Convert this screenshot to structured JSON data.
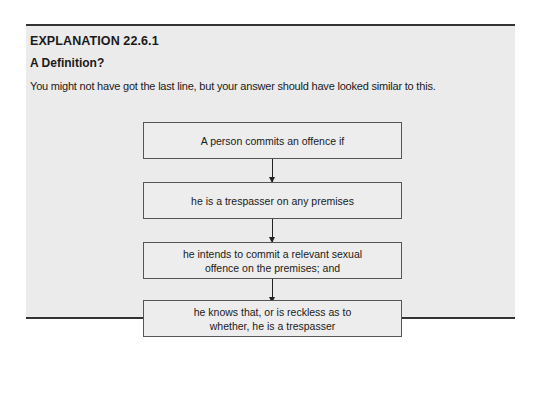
{
  "header": {
    "label": "EXPLANATION 22.6.1",
    "title": "A Definition?"
  },
  "intro": "You might not have got the last line, but your answer should have looked similar to this.",
  "flowchart": {
    "steps": [
      {
        "text": "A person commits an offence if"
      },
      {
        "text": "he is a trespasser on any premises"
      },
      {
        "text": "he intends to commit a relevant sexual offence on the premises; and"
      },
      {
        "text": "he knows that, or is reckless as to whether, he is a trespasser"
      }
    ]
  }
}
